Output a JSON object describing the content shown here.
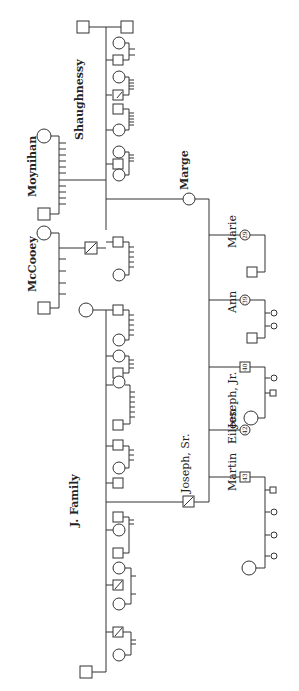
{
  "labels": {
    "shaughnessy": "Shaughnessy",
    "moynihan": "Moynihan",
    "mccooey": "McCooey",
    "marge": "Marge",
    "j_family": "J. Family",
    "joseph_sr": "Joseph, Sr.",
    "marie": "Marie",
    "ann": "Ann",
    "joseph_jr": "Joseph, Jr.",
    "eileen": "Eileen",
    "martin": "Martin"
  },
  "ages": {
    "marie": "29",
    "ann": "39",
    "joseph_jr": "40",
    "eileen": "42",
    "martin": "43"
  },
  "children": [
    {
      "name": "Marie",
      "age": "29",
      "sex": "female"
    },
    {
      "name": "Ann",
      "age": "39",
      "sex": "female"
    },
    {
      "name": "Joseph, Jr.",
      "age": "40",
      "sex": "male"
    },
    {
      "name": "Eileen",
      "age": "42",
      "sex": "female"
    },
    {
      "name": "Martin",
      "age": "43",
      "sex": "male"
    }
  ],
  "parents": [
    {
      "name": "Marge",
      "family": "Shaughnessy",
      "sex": "female"
    },
    {
      "name": "Joseph, Sr.",
      "family": "J. Family",
      "sex": "male",
      "deceased": true
    }
  ]
}
